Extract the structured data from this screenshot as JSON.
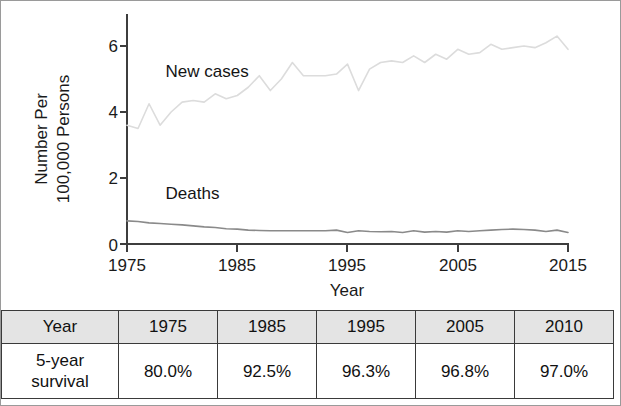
{
  "figure": {
    "border_color": "#9a9a9a",
    "background": "#ffffff"
  },
  "chart_data": {
    "type": "line",
    "title": "",
    "xlabel": "Year",
    "ylabel": "Number Per 100,000 Persons",
    "ylabel_lines": [
      "Number Per",
      "100,000 Persons"
    ],
    "xlim": [
      1975,
      2015
    ],
    "ylim": [
      0,
      6.6
    ],
    "xticks": [
      1975,
      1985,
      1995,
      2005,
      2015
    ],
    "xtick_labels": [
      "1975",
      "1985",
      "1995",
      "2005",
      "2015"
    ],
    "yticks": [
      0,
      2,
      4,
      6
    ],
    "ytick_labels": [
      "0",
      "2",
      "4",
      "6"
    ],
    "grid": false,
    "legend_position": "inline-annotations",
    "x": [
      1975,
      1976,
      1977,
      1978,
      1979,
      1980,
      1981,
      1982,
      1983,
      1984,
      1985,
      1986,
      1987,
      1988,
      1989,
      1990,
      1991,
      1992,
      1993,
      1994,
      1995,
      1996,
      1997,
      1998,
      1999,
      2000,
      2001,
      2002,
      2003,
      2004,
      2005,
      2006,
      2007,
      2008,
      2009,
      2010,
      2011,
      2012,
      2013,
      2014,
      2015
    ],
    "series": [
      {
        "name": "New cases",
        "color": "#dcdcdc",
        "label_x": 1978.5,
        "label_y": 5.05,
        "values": [
          3.6,
          3.5,
          4.25,
          3.6,
          4.0,
          4.3,
          4.35,
          4.3,
          4.55,
          4.4,
          4.5,
          4.75,
          5.1,
          4.65,
          5.0,
          5.5,
          5.1,
          5.1,
          5.1,
          5.15,
          5.45,
          4.65,
          5.3,
          5.5,
          5.55,
          5.5,
          5.7,
          5.5,
          5.75,
          5.6,
          5.9,
          5.75,
          5.8,
          6.05,
          5.9,
          5.95,
          6.0,
          5.95,
          6.1,
          6.3,
          5.9
        ]
      },
      {
        "name": "Deaths",
        "color": "#8a8a8a",
        "label_x": 1978.5,
        "label_y": 1.35,
        "values": [
          0.7,
          0.68,
          0.64,
          0.62,
          0.6,
          0.58,
          0.55,
          0.52,
          0.5,
          0.46,
          0.45,
          0.42,
          0.41,
          0.4,
          0.4,
          0.4,
          0.4,
          0.4,
          0.4,
          0.42,
          0.35,
          0.4,
          0.38,
          0.37,
          0.38,
          0.35,
          0.4,
          0.36,
          0.38,
          0.36,
          0.4,
          0.38,
          0.4,
          0.42,
          0.44,
          0.45,
          0.44,
          0.42,
          0.38,
          0.42,
          0.35
        ]
      }
    ]
  },
  "table": {
    "header": [
      "Year",
      "1975",
      "1985",
      "1995",
      "2005",
      "2010"
    ],
    "rows": [
      {
        "label_lines": [
          "5-year",
          "survival"
        ],
        "values": [
          "80.0%",
          "92.5%",
          "96.3%",
          "96.8%",
          "97.0%"
        ]
      }
    ],
    "header_background": "#e4e4e4",
    "border_color": "#3a3a3a"
  }
}
